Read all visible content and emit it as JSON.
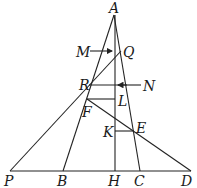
{
  "diagram": {
    "type": "geometry",
    "labels": {
      "A": "A",
      "Q": "Q",
      "M": "M",
      "N": "N",
      "R": "R",
      "L": "L",
      "F": "F",
      "E": "E",
      "K": "K",
      "P": "P",
      "B": "B",
      "H": "H",
      "C": "C",
      "D": "D"
    },
    "segments": [
      "AB",
      "AC",
      "AH",
      "PD",
      "PQ",
      "FD",
      "RL_horizontal",
      "FL_horizontal",
      "KE_horizontal"
    ],
    "arrows": [
      "M→Q",
      "N→AH"
    ],
    "color": "#222222"
  }
}
